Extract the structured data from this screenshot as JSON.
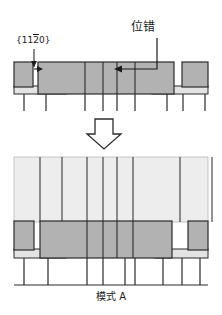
{
  "figure": {
    "caption": "模式 A",
    "labels": {
      "miller_index_prefix": "{11",
      "miller_index_bar": "2",
      "miller_index_suffix": "0}",
      "miller_index_full": "{11̄20}",
      "dislocation": "位错"
    },
    "colors": {
      "medium_gray": "#b2b2b2",
      "light_gray": "#e0e0e0",
      "pale_gray": "#ededed",
      "outline": "#2b2b2b",
      "text": "#1a1a1a",
      "background": "#ffffff"
    },
    "panels": [
      {
        "name": "before-panel",
        "description": "Upper cross-section: stepped epitaxial layer with gaps and a dislocation arrow",
        "top_slab_y": 62,
        "top_slab_height": 24,
        "base_band_y": 86,
        "base_band_height": 7,
        "tick_band_y": 93,
        "tick_band_height": 18,
        "segments_gray": [
          {
            "x": 14,
            "width": 18
          },
          {
            "x": 38,
            "width": 136
          },
          {
            "x": 182,
            "width": 26
          }
        ],
        "segments_light": [
          {
            "x": 14,
            "width": 52
          },
          {
            "x": 152,
            "width": 56
          }
        ],
        "internal_lines_x": [
          85,
          103,
          117,
          135
        ],
        "tick_lines_x": [
          24,
          46,
          85,
          103,
          117,
          135,
          167,
          183,
          205
        ]
      },
      {
        "name": "after-panel",
        "description": "Lower cross-section: merged layer after coalescence, mode A",
        "pale_block_y": 157,
        "pale_block_height": 64,
        "gray_slab_y": 221,
        "gray_slab_height": 28,
        "light_band_y": 249,
        "light_band_height": 8,
        "tick_band_y": 257,
        "tick_band_height": 28,
        "pale_lines_x": [
          40,
          62,
          87,
          103,
          117,
          133,
          180,
          212
        ],
        "gray_segments": [
          {
            "x": 14,
            "width": 20
          },
          {
            "x": 40,
            "width": 132
          },
          {
            "x": 188,
            "width": 20
          }
        ],
        "light_segments": [
          {
            "x": 14,
            "width": 52
          },
          {
            "x": 155,
            "width": 53
          }
        ],
        "internal_lines_x": [
          87,
          103,
          117,
          133
        ],
        "tick_lines_x": [
          24,
          48,
          87,
          103,
          125,
          135,
          163,
          182,
          200
        ]
      }
    ],
    "annotations": [
      {
        "name": "miller-callout",
        "target_x": 40,
        "target_y": 70,
        "elbow_x": 34,
        "elbow_y": 50
      },
      {
        "name": "dislocation-callout",
        "target_x": 116,
        "target_y": 68,
        "elbow_x": 157,
        "elbow_y": 38
      }
    ],
    "transition_arrow": {
      "name": "down-arrow",
      "cx": 104,
      "top_y": 119,
      "bottom_y": 148,
      "shaft_half_width": 9,
      "head_half_width": 17
    }
  }
}
